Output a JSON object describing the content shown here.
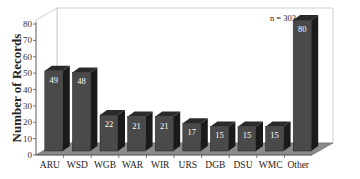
{
  "chart_data": {
    "type": "bar",
    "title": "",
    "xlabel": "",
    "ylabel": "Number of Records",
    "ylim": [
      0,
      80
    ],
    "yticks": [
      0,
      10,
      20,
      30,
      40,
      50,
      60,
      70,
      80
    ],
    "categories": [
      "ARU",
      "WSD",
      "WGB",
      "WAR",
      "WIR",
      "URS",
      "DGB",
      "DSU",
      "WMC",
      "Other"
    ],
    "values": [
      49,
      48,
      22,
      21,
      21,
      17,
      15,
      15,
      15,
      80
    ],
    "data_labels": [
      "49",
      "48",
      "22",
      "21",
      "21",
      "17",
      "15",
      "15",
      "15",
      "80"
    ],
    "annotation": "n = 303",
    "style": "3d",
    "grid": false,
    "legend": null,
    "colors": {
      "bar_front": "#4a4a4a",
      "bar_side": "#1a1a1a",
      "bar_top": "#2a2a2a",
      "floor": "#8a8a8a",
      "wall": "#ffffff",
      "wall_edge": "#d0d0d0"
    }
  }
}
